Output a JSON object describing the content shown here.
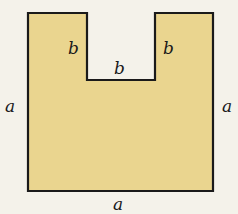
{
  "diagram": {
    "type": "geometric-figure",
    "colors": {
      "fill": "#ead58f",
      "stroke": "#1a1a1a",
      "background": "#f4f2ea"
    },
    "shape": {
      "outer": {
        "left": 28,
        "top": 13,
        "right": 213,
        "bottom": 191
      },
      "notch": {
        "left": 87,
        "right": 155,
        "bottom": 80
      }
    },
    "labels": {
      "left_side": "a",
      "right_side": "a",
      "bottom_side": "a",
      "notch_left": "b",
      "notch_right": "b",
      "notch_bottom": "b"
    }
  }
}
